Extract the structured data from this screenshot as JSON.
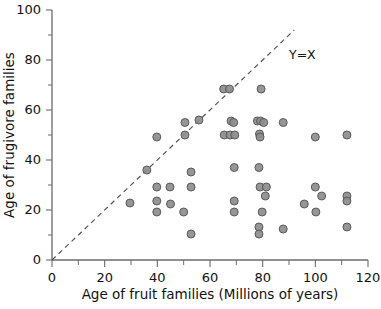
{
  "chart_data": {
    "type": "scatter",
    "title": "",
    "xlabel": "Age of fruit families (Millions of years)",
    "ylabel": "Age of frugivore families",
    "xlim": [
      0,
      120
    ],
    "ylim": [
      0,
      100
    ],
    "xticks": [
      0,
      20,
      40,
      60,
      80,
      100,
      120
    ],
    "xticklabels": [
      "0",
      "20",
      "40",
      "60",
      "80",
      "100",
      "120"
    ],
    "xminorticks": [
      10,
      30,
      50,
      70,
      90,
      110
    ],
    "yticks": [
      0,
      20,
      40,
      60,
      80,
      100
    ],
    "yticklabels": [
      "0",
      "20",
      "40",
      "60",
      "80",
      "100"
    ],
    "yminorticks": [
      10,
      30,
      50,
      70,
      90
    ],
    "grid": false,
    "legend": false,
    "marker": {
      "shape": "circle",
      "radius": 4,
      "fill": "#8d8d8d",
      "stroke": "#5a5a5a"
    },
    "annotations": [
      {
        "text": "Y=X",
        "x": 90,
        "y": 82,
        "kind": "reference-line-label"
      }
    ],
    "reference_line": {
      "label": "Y=X",
      "style": "dashed",
      "color": "#55555a",
      "x_start": 0,
      "y_start": 0,
      "x_end": 92,
      "y_end": 92
    },
    "series": [
      {
        "name": "family pairs",
        "points": [
          [
            29.6,
            22.8
          ],
          [
            36.0,
            36.0
          ],
          [
            39.8,
            49.2
          ],
          [
            39.8,
            29.2
          ],
          [
            39.8,
            23.6
          ],
          [
            39.8,
            19.2
          ],
          [
            44.8,
            29.2
          ],
          [
            45.0,
            22.4
          ],
          [
            50.5,
            55.0
          ],
          [
            50.5,
            50.0
          ],
          [
            50.0,
            19.2
          ],
          [
            52.8,
            35.2
          ],
          [
            52.8,
            29.2
          ],
          [
            52.8,
            10.4
          ],
          [
            55.8,
            56.0
          ],
          [
            65.2,
            68.4
          ],
          [
            67.4,
            68.4
          ],
          [
            68.0,
            55.6
          ],
          [
            69.0,
            55.0
          ],
          [
            65.4,
            50.0
          ],
          [
            67.6,
            50.0
          ],
          [
            69.4,
            50.0
          ],
          [
            69.2,
            37.0
          ],
          [
            69.2,
            23.6
          ],
          [
            69.2,
            19.2
          ],
          [
            79.4,
            68.4
          ],
          [
            78.0,
            55.6
          ],
          [
            79.2,
            55.6
          ],
          [
            80.4,
            55.0
          ],
          [
            78.8,
            50.4
          ],
          [
            79.0,
            49.2
          ],
          [
            78.6,
            37.0
          ],
          [
            79.0,
            29.2
          ],
          [
            81.4,
            29.2
          ],
          [
            81.0,
            25.6
          ],
          [
            79.8,
            19.2
          ],
          [
            78.6,
            13.2
          ],
          [
            78.6,
            10.4
          ],
          [
            87.8,
            55.0
          ],
          [
            87.8,
            12.4
          ],
          [
            95.8,
            22.4
          ],
          [
            100.0,
            49.2
          ],
          [
            100.0,
            29.2
          ],
          [
            100.2,
            19.2
          ],
          [
            102.4,
            25.6
          ],
          [
            112.0,
            50.0
          ],
          [
            112.0,
            25.6
          ],
          [
            112.0,
            23.6
          ],
          [
            112.0,
            13.2
          ]
        ]
      }
    ]
  },
  "figure": {
    "axis_color": "#6b6b6b",
    "text_color": "#111111",
    "background": "#ffffff"
  }
}
